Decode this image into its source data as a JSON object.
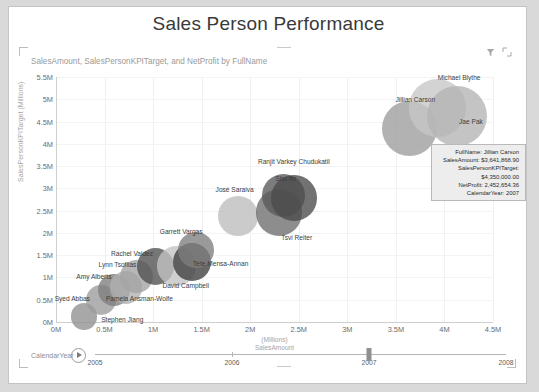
{
  "window": {
    "title": "Sales Person Performance"
  },
  "header": {
    "subtitle": "SalesAmount, SalesPersonKPITarget, and NetProfit by FullName",
    "icons": [
      {
        "name": "filter-icon",
        "label": "Filters"
      },
      {
        "name": "focus-mode-icon",
        "label": "Focus mode"
      }
    ]
  },
  "tooltip": {
    "rows": [
      {
        "key": "FullName:",
        "value": "Jillian Carson"
      },
      {
        "key": "SalesAmount:",
        "value": "$3,641,868.90"
      },
      {
        "key": "SalesPersonKPITarget:",
        "value": "$4,350,000.00"
      },
      {
        "key": "NetProfit:",
        "value": "2,452,654.36"
      },
      {
        "key": "CalendarYear:",
        "value": "2007"
      }
    ]
  },
  "slider": {
    "label": "CalendarYear",
    "play_label": "Play",
    "ticks": [
      "2005",
      "2006",
      "2007",
      "2008"
    ],
    "value": "2007"
  },
  "chart_data": {
    "type": "scatter",
    "title": "Sales Person Performance",
    "subtitle": "SalesAmount, SalesPersonKPITarget, and NetProfit by FullName",
    "xlabel": "SalesAmount",
    "xlabel_unit": "(Millions)",
    "ylabel": "SalesPersonKPITarget",
    "ylabel_unit": "(Millions)",
    "xlim": [
      0,
      4.5
    ],
    "ylim": [
      0,
      5.5
    ],
    "xticks": [
      "0M",
      "0.5M",
      "1M",
      "1.5M",
      "2M",
      "2.5M",
      "3M",
      "3.5M",
      "4M",
      "4.5M"
    ],
    "xtick_values": [
      0,
      0.5,
      1,
      1.5,
      2,
      2.5,
      3,
      3.5,
      4,
      4.5
    ],
    "yticks": [
      "0M",
      "0.5M",
      "1M",
      "1.5M",
      "2M",
      "2.5M",
      "3M",
      "3.5M",
      "4M",
      "4.5M",
      "5M",
      "5.5M"
    ],
    "ytick_values": [
      0,
      0.5,
      1,
      1.5,
      2,
      2.5,
      3,
      3.5,
      4,
      4.5,
      5,
      5.5
    ],
    "grid": true,
    "legend": false,
    "size_measure": "NetProfit",
    "points": [
      {
        "label": "Stephen Jiang",
        "x": 0.29,
        "y": 0.12,
        "size": 0.55,
        "color": "#8f8f8f",
        "label_dx": 17,
        "label_dy": 3
      },
      {
        "label": "Syed Abbas",
        "x": 0.46,
        "y": 0.5,
        "size": 0.8,
        "color": "#9b9b9b",
        "label_dx": -46,
        "label_dy": -1
      },
      {
        "label": "Amy Alberts",
        "x": 0.6,
        "y": 0.72,
        "size": 0.92,
        "color": "#7e7e7e",
        "label_dx": -38,
        "label_dy": -13
      },
      {
        "label": "Pamela Ansman-Wolfe",
        "x": 0.72,
        "y": 0.78,
        "size": 0.95,
        "color": "#b0b0b0",
        "label_dx": -20,
        "label_dy": 12
      },
      {
        "label": "Lynn Tsoflias",
        "x": 0.83,
        "y": 1.02,
        "size": 1.0,
        "color": "#a3a3a3",
        "label_dx": -38,
        "label_dy": -12
      },
      {
        "label": "Rachel Valdez",
        "x": 1.02,
        "y": 1.24,
        "size": 1.25,
        "color": "#4f4f4f",
        "label_dx": -44,
        "label_dy": -13
      },
      {
        "label": "David Campbell",
        "x": 1.24,
        "y": 1.26,
        "size": 1.4,
        "color": "#c3c3c3",
        "label_dx": -14,
        "label_dy": 20
      },
      {
        "label": "Tete Mensa-Annan",
        "x": 1.4,
        "y": 1.35,
        "size": 1.32,
        "color": "#3d3d3d",
        "label_dx": 1,
        "label_dy": 2
      },
      {
        "label": "Garrett Vargas",
        "x": 1.44,
        "y": 1.62,
        "size": 1.22,
        "color": "#7d7d7d",
        "label_dx": -36,
        "label_dy": -18
      },
      {
        "label": "José Saraiva",
        "x": 1.87,
        "y": 2.38,
        "size": 1.45,
        "color": "#bdbdbd",
        "label_dx": -22,
        "label_dy": -26
      },
      {
        "label": "Tsvi Reiter",
        "x": 2.3,
        "y": 2.46,
        "size": 1.85,
        "color": "#6d6d6d",
        "label_dx": 2,
        "label_dy": 26
      },
      {
        "label": "Shu Ito",
        "x": 2.34,
        "y": 2.84,
        "size": 1.62,
        "color": "#585858",
        "label_dx": -8,
        "label_dy": -16
      },
      {
        "label": "Ranjit Varkey Chudukatil",
        "x": 2.45,
        "y": 2.78,
        "size": 1.8,
        "color": "#4a4a4a",
        "label_dx": -36,
        "label_dy": -36
      },
      {
        "label": "Jillian Carson",
        "x": 3.64,
        "y": 4.35,
        "size": 2.45,
        "color": "#9c9c9c",
        "label_dx": -14,
        "label_dy": -28
      },
      {
        "label": "Michael Blythe",
        "x": 3.93,
        "y": 4.8,
        "size": 2.6,
        "color": "#c6c6c6",
        "label_dx": 0,
        "label_dy": -30
      },
      {
        "label": "Jae Pak",
        "x": 4.13,
        "y": 4.62,
        "size": 2.75,
        "color": "#b4b4b4",
        "label_dx": 2,
        "label_dy": 6
      }
    ]
  }
}
